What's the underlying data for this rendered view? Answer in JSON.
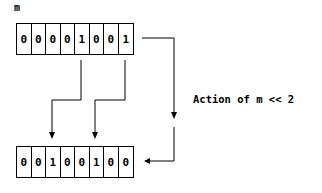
{
  "variable_label": "m",
  "input_bits": [
    "0",
    "0",
    "0",
    "0",
    "1",
    "0",
    "0",
    "1"
  ],
  "output_bits": [
    "0",
    "0",
    "1",
    "0",
    "0",
    "1",
    "0",
    "0"
  ],
  "caption": "Action of m << 2",
  "colors": {
    "line": "#000000",
    "background": "#ffffff"
  }
}
